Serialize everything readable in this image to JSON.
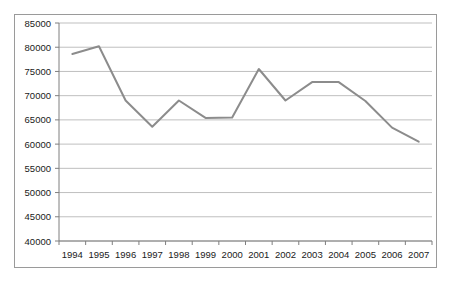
{
  "chart_data": {
    "type": "line",
    "title": "",
    "subtitle": "",
    "xlabel": "",
    "ylabel": "",
    "categories": [
      "1994",
      "1995",
      "1996",
      "1997",
      "1998",
      "1999",
      "2000",
      "2001",
      "2002",
      "2003",
      "2004",
      "2005",
      "2006",
      "2007"
    ],
    "values": [
      78600,
      80200,
      69000,
      63600,
      69000,
      65400,
      65500,
      75500,
      69000,
      72800,
      72800,
      68900,
      63400,
      60500
    ],
    "series": [
      {
        "name": "",
        "values": [
          78600,
          80200,
          69000,
          63600,
          69000,
          65400,
          65500,
          75500,
          69000,
          72800,
          72800,
          68900,
          63400,
          60500
        ]
      }
    ],
    "ylim": [
      40000,
      85000
    ],
    "ytick_values": [
      40000,
      45000,
      50000,
      55000,
      60000,
      65000,
      70000,
      75000,
      80000,
      85000
    ],
    "ytick_labels": [
      "40000",
      "45000",
      "50000",
      "55000",
      "60000",
      "65000",
      "70000",
      "75000",
      "80000",
      "85000"
    ],
    "xtick_labels": [
      "1994",
      "1995",
      "1996",
      "1997",
      "1998",
      "1999",
      "2000",
      "2001",
      "2002",
      "2003",
      "2004",
      "2005",
      "2006",
      "2007"
    ],
    "grid": "horizontal",
    "legend": "none",
    "line_color": "#8c8c8c",
    "grid_color": "#bfbfbf",
    "axis_color": "#7f7f7f",
    "border_color": "#9a9a9a",
    "background_color": "#ffffff",
    "annotations": []
  }
}
